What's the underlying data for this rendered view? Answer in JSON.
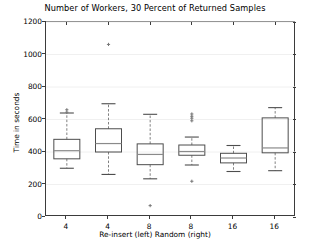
{
  "chart_data": {
    "type": "box",
    "title": "Number of Workers, 30 Percent of Returned Samples",
    "xlabel": "Re-insert (left)   Random (right)",
    "ylabel": "Time in seconds",
    "ylim": [
      0,
      1200
    ],
    "yticks": [
      0,
      200,
      400,
      600,
      800,
      1000,
      1200
    ],
    "ytick_labels": [
      "0",
      "200",
      "400",
      "600",
      "800",
      "1000",
      "1200"
    ],
    "categories": [
      "4",
      "4",
      "8",
      "8",
      "16",
      "16"
    ],
    "xtick_labels": [
      "4",
      "4",
      "8",
      "8",
      "16",
      "16"
    ],
    "grid": true,
    "grid_axis": "y",
    "legend": "none",
    "boxes": [
      {
        "label": "4",
        "group": "Re-insert",
        "whisker_low": 300,
        "q1": 358,
        "median": 408,
        "q3": 478,
        "whisker_high": 640,
        "outliers": [
          645,
          660
        ]
      },
      {
        "label": "4",
        "group": "Random",
        "whisker_low": 262,
        "q1": 400,
        "median": 452,
        "q3": 543,
        "whisker_high": 697,
        "outliers": [
          1062
        ]
      },
      {
        "label": "8",
        "group": "Re-insert",
        "whisker_low": 235,
        "q1": 322,
        "median": 385,
        "q3": 450,
        "whisker_high": 632,
        "outliers": [
          70
        ]
      },
      {
        "label": "8",
        "group": "Random",
        "whisker_low": 320,
        "q1": 380,
        "median": 403,
        "q3": 443,
        "whisker_high": 492,
        "outliers": [
          592,
          608,
          620,
          634,
          220
        ]
      },
      {
        "label": "16",
        "group": "Re-insert",
        "whisker_low": 280,
        "q1": 333,
        "median": 363,
        "q3": 392,
        "whisker_high": 440,
        "outliers": []
      },
      {
        "label": "16",
        "group": "Random",
        "whisker_low": 285,
        "q1": 395,
        "median": 425,
        "q3": 610,
        "whisker_high": 673,
        "outliers": []
      }
    ],
    "colors": {
      "box_edge": "#4d4d4d",
      "median": "#8a8a8a",
      "whisker": "#808080",
      "cap": "#4d4d4d",
      "outlier": "#777777",
      "grid": "#f0f0f0",
      "axis": "#3b3b3b",
      "background": "#ffffff",
      "text": "#000000"
    }
  }
}
